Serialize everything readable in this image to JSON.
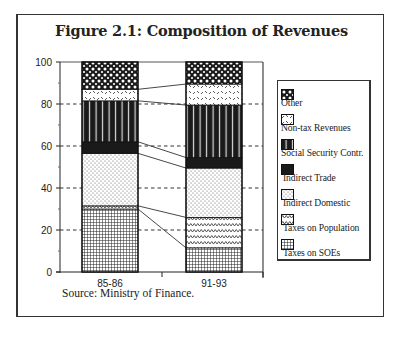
{
  "figure": {
    "title": "Figure 2.1: Composition of Revenues",
    "source": "Source: Ministry of Finance."
  },
  "colors": {
    "ink": "#1a1a1a",
    "frame": "#333333",
    "background": "#ffffff"
  },
  "legend": {
    "items": [
      {
        "label": "Other",
        "pattern": "crosshatch"
      },
      {
        "label": "Non-tax Revenues",
        "pattern": "diagonal-dash"
      },
      {
        "label": "Social Security Contr.",
        "pattern": "vertical-stripes"
      },
      {
        "label": "Indirect Trade",
        "pattern": "solid-black"
      },
      {
        "label": "Indirect Domestic",
        "pattern": "dots"
      },
      {
        "label": "Taxes on Population",
        "pattern": "wave"
      },
      {
        "label": "Taxes on SOEs",
        "pattern": "grid"
      }
    ]
  },
  "chart_data": {
    "type": "bar",
    "stacked": true,
    "title": "Figure 2.1: Composition of Revenues",
    "xlabel": "",
    "ylabel": "",
    "ylim": [
      0,
      100
    ],
    "yticks": [
      0,
      20,
      40,
      60,
      80,
      100
    ],
    "grid": "dashed horizontal at 20, 40, 60, 80 (between and right of bars)",
    "legend_position": "right",
    "categories": [
      "85-86",
      "91-93"
    ],
    "series": [
      {
        "name": "Taxes on SOEs",
        "pattern": "grid",
        "values": [
          30,
          11.5
        ]
      },
      {
        "name": "Taxes on Population",
        "pattern": "wave",
        "values": [
          1.5,
          14.5
        ]
      },
      {
        "name": "Indirect Domestic",
        "pattern": "dots",
        "values": [
          25,
          23.5
        ]
      },
      {
        "name": "Indirect Trade",
        "pattern": "solid-black",
        "values": [
          5.5,
          5
        ]
      },
      {
        "name": "Social Security Contr.",
        "pattern": "vertical-stripes",
        "values": [
          19.5,
          25
        ]
      },
      {
        "name": "Non-tax Revenues",
        "pattern": "diagonal-dash",
        "values": [
          5.5,
          10
        ]
      },
      {
        "name": "Other",
        "pattern": "crosshatch",
        "values": [
          13,
          10.5
        ]
      }
    ],
    "connector_lines": true,
    "source": "Source: Ministry of Finance."
  }
}
